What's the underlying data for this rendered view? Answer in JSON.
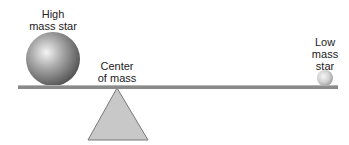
{
  "diagram": {
    "high_mass_label": [
      "High",
      "mass star"
    ],
    "center_label": [
      "Center",
      "of mass"
    ],
    "low_mass_label": [
      "Low",
      "mass",
      "star"
    ]
  }
}
